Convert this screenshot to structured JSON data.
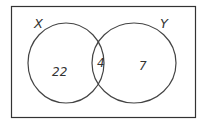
{
  "diagram": {
    "type": "venn",
    "sets": [
      {
        "label": "X"
      },
      {
        "label": "Y"
      }
    ],
    "regions": {
      "x_only": "22",
      "intersection": "4",
      "y_only": "7"
    }
  }
}
